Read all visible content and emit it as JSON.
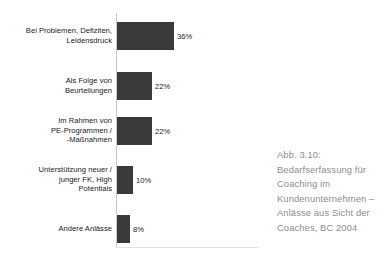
{
  "figure": {
    "caption_lines": [
      "Abb. 3.10:",
      "Bedarfserfassung für",
      "Coaching im",
      "Kundenunternehmen –",
      "Anlässe aus Sicht der",
      "Coaches, BC 2004"
    ],
    "caption_full": "Abb. 3.10: Bedarfserfassung für Coaching im Kundenunternehmen – Anlässe aus Sicht der Coaches, BC 2004"
  },
  "colors": {
    "bar": "#3b3a3a",
    "axis": "#c9c9c9",
    "baseline": "#e2e2e2",
    "label_text": "#23201f",
    "caption_text": "#8d8d8d",
    "background": "#ffffff"
  },
  "chart_data": {
    "type": "bar",
    "orientation": "horizontal",
    "title": "",
    "subtitle": "",
    "xlabel": "",
    "ylabel": "",
    "grid": false,
    "legend": "none",
    "xlim": [
      0,
      40
    ],
    "categories": [
      "Bei Problemen, Defiziten,\nLeidensdruck",
      "Als Folge von\nBeurteilungen",
      "Im Rahmen von\nPE-Programmen /\n-Maßnahmen",
      "Unterstützung neuer /\njunger FK, High\nPotentials",
      "Andere Anlässe"
    ],
    "values": [
      36,
      22,
      22,
      10,
      8
    ],
    "value_labels": [
      "36%",
      "22%",
      "22%",
      "10%",
      "8%"
    ],
    "bars": [
      {
        "label": "Bei Problemen, Defiziten,\nLeidensdruck",
        "value": 36,
        "value_label": "36%",
        "top": 22,
        "height": 28,
        "width": 57,
        "label_top": 26,
        "value_top": 32
      },
      {
        "label": "Als Folge von\nBeurteilungen",
        "value": 22,
        "value_label": "22%",
        "top": 72,
        "height": 28,
        "width": 35,
        "label_top": 76,
        "value_top": 82
      },
      {
        "label": "Im Rahmen von\nPE-Programmen /\n-Maßnahmen",
        "value": 22,
        "value_label": "22%",
        "top": 117,
        "height": 28,
        "width": 35,
        "label_top": 116,
        "value_top": 127
      },
      {
        "label": "Unterstützung neuer /\njunger FK, High\nPotentials",
        "value": 10,
        "value_label": "10%",
        "top": 166,
        "height": 28,
        "width": 16,
        "label_top": 165,
        "value_top": 176
      },
      {
        "label": "Andere Anlässe",
        "value": 8,
        "value_label": "8%",
        "top": 215,
        "height": 28,
        "width": 13,
        "label_top": 224,
        "value_top": 225
      }
    ]
  }
}
